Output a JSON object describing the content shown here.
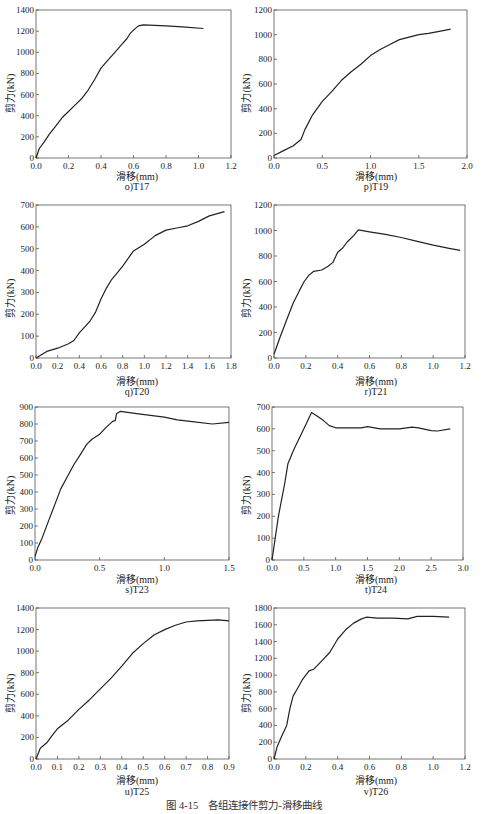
{
  "figure": {
    "caption": "图 4-15　各组连接件剪力-滑移曲线"
  },
  "chart_data": [
    {
      "id": "o",
      "type": "line",
      "subtitle": "o)T17",
      "xlabel": "滑移(mm)",
      "ylabel": "剪力(kN)",
      "xlim": [
        0,
        1.2
      ],
      "ylim": [
        0,
        1400
      ],
      "xticks": [
        0.0,
        0.2,
        0.4,
        0.6,
        0.8,
        1.0,
        1.2
      ],
      "xtick_labels": [
        "0.0",
        "0.2",
        "0.4",
        "0.6",
        "0.8",
        "1.0",
        "1.2"
      ],
      "yticks": [
        0,
        200,
        400,
        600,
        800,
        1000,
        1200,
        1400
      ],
      "grid": false,
      "x": [
        0,
        0.02,
        0.05,
        0.08,
        0.12,
        0.16,
        0.2,
        0.24,
        0.28,
        0.32,
        0.36,
        0.4,
        0.44,
        0.48,
        0.52,
        0.56,
        0.58,
        0.6,
        0.63,
        0.66,
        0.8,
        0.9,
        1.03
      ],
      "y": [
        0,
        90,
        150,
        220,
        300,
        380,
        440,
        500,
        560,
        640,
        740,
        850,
        920,
        990,
        1060,
        1130,
        1180,
        1210,
        1250,
        1260,
        1250,
        1240,
        1225
      ]
    },
    {
      "id": "p",
      "type": "line",
      "subtitle": "p)T19",
      "xlabel": "滑移(mm)",
      "ylabel": "剪力(kN)",
      "xlim": [
        0,
        2.0
      ],
      "ylim": [
        0,
        1200
      ],
      "xticks": [
        0.0,
        0.5,
        1.0,
        1.5,
        2.0
      ],
      "xtick_labels": [
        "0.0",
        "0.5",
        "1.0",
        "1.5",
        "2.0"
      ],
      "yticks": [
        0,
        200,
        400,
        600,
        800,
        1000,
        1200
      ],
      "grid": false,
      "x": [
        0,
        0.1,
        0.2,
        0.28,
        0.32,
        0.4,
        0.5,
        0.6,
        0.7,
        0.8,
        0.9,
        1.0,
        1.1,
        1.2,
        1.3,
        1.4,
        1.5,
        1.6,
        1.7,
        1.83
      ],
      "y": [
        20,
        60,
        100,
        150,
        230,
        350,
        460,
        540,
        630,
        700,
        760,
        830,
        880,
        920,
        960,
        980,
        1000,
        1010,
        1025,
        1045
      ]
    },
    {
      "id": "q",
      "type": "line",
      "subtitle": "q)T20",
      "xlabel": "滑移(mm)",
      "ylabel": "剪力(kN)",
      "xlim": [
        0,
        1.8
      ],
      "ylim": [
        0,
        700
      ],
      "xticks": [
        0.0,
        0.2,
        0.4,
        0.6,
        0.8,
        1.0,
        1.2,
        1.4,
        1.6,
        1.8
      ],
      "xtick_labels": [
        "0.0",
        "0.2",
        "0.4",
        "0.6",
        "0.8",
        "1.0",
        "1.2",
        "1.4",
        "1.6",
        "1.8"
      ],
      "yticks": [
        0,
        100,
        200,
        300,
        400,
        500,
        600,
        700
      ],
      "grid": false,
      "x": [
        0,
        0.1,
        0.2,
        0.3,
        0.35,
        0.4,
        0.5,
        0.55,
        0.6,
        0.65,
        0.7,
        0.75,
        0.8,
        0.9,
        1.0,
        1.1,
        1.2,
        1.3,
        1.4,
        1.5,
        1.6,
        1.74
      ],
      "y": [
        0,
        30,
        45,
        65,
        80,
        115,
        170,
        210,
        270,
        320,
        360,
        390,
        420,
        490,
        520,
        560,
        585,
        595,
        605,
        625,
        650,
        670
      ]
    },
    {
      "id": "r",
      "type": "line",
      "subtitle": "r)T21",
      "xlabel": "滑移(mm)",
      "ylabel": "剪力(kN)",
      "xlim": [
        0,
        1.2
      ],
      "ylim": [
        0,
        1200
      ],
      "xticks": [
        0.0,
        0.2,
        0.4,
        0.6,
        0.8,
        1.0,
        1.2
      ],
      "xtick_labels": [
        "0.0",
        "0.2",
        "0.4",
        "0.6",
        "0.8",
        "1.0",
        "1.2"
      ],
      "yticks": [
        0,
        200,
        400,
        600,
        800,
        1000,
        1200
      ],
      "grid": false,
      "x": [
        0,
        0.04,
        0.08,
        0.12,
        0.16,
        0.19,
        0.22,
        0.25,
        0.3,
        0.34,
        0.37,
        0.4,
        0.43,
        0.46,
        0.5,
        0.53,
        0.6,
        0.7,
        0.8,
        0.9,
        1.0,
        1.1,
        1.17
      ],
      "y": [
        30,
        170,
        300,
        430,
        530,
        600,
        650,
        680,
        690,
        720,
        750,
        830,
        860,
        910,
        960,
        1005,
        990,
        970,
        945,
        915,
        885,
        860,
        845
      ]
    },
    {
      "id": "s",
      "type": "line",
      "subtitle": "s)T23",
      "xlabel": "滑移(mm)",
      "ylabel": "剪力(kN)",
      "xlim": [
        0,
        1.5
      ],
      "ylim": [
        0,
        900
      ],
      "xticks": [
        0.0,
        0.5,
        1.0,
        1.5
      ],
      "xtick_labels": [
        "0.0",
        "0.5",
        "1.0",
        "1.5"
      ],
      "yticks": [
        0,
        100,
        200,
        300,
        400,
        500,
        600,
        700,
        800,
        900
      ],
      "grid": false,
      "x": [
        0,
        0.02,
        0.05,
        0.1,
        0.15,
        0.2,
        0.25,
        0.3,
        0.35,
        0.4,
        0.44,
        0.5,
        0.55,
        0.6,
        0.62,
        0.63,
        0.66,
        0.8,
        1.0,
        1.1,
        1.2,
        1.37,
        1.5
      ],
      "y": [
        20,
        70,
        120,
        220,
        320,
        420,
        490,
        560,
        620,
        680,
        710,
        740,
        780,
        815,
        820,
        860,
        875,
        860,
        840,
        825,
        815,
        800,
        810
      ]
    },
    {
      "id": "t",
      "type": "line",
      "subtitle": "t)T24",
      "xlabel": "滑移(mm)",
      "ylabel": "剪力(kN)",
      "xlim": [
        0,
        3.0
      ],
      "ylim": [
        0,
        700
      ],
      "xticks": [
        0.0,
        0.5,
        1.0,
        1.5,
        2.0,
        2.5,
        3.0
      ],
      "xtick_labels": [
        "0.0",
        "0.5",
        "1.0",
        "1.5",
        "2.0",
        "2.5",
        "3.0"
      ],
      "yticks": [
        0,
        100,
        200,
        300,
        400,
        500,
        600,
        700
      ],
      "grid": false,
      "x": [
        0,
        0.05,
        0.1,
        0.2,
        0.25,
        0.35,
        0.45,
        0.55,
        0.62,
        0.7,
        0.8,
        0.9,
        1.0,
        1.2,
        1.4,
        1.5,
        1.7,
        2.0,
        2.2,
        2.3,
        2.5,
        2.6,
        2.8
      ],
      "y": [
        0,
        100,
        200,
        350,
        440,
        510,
        570,
        630,
        675,
        660,
        640,
        615,
        605,
        605,
        605,
        610,
        600,
        600,
        608,
        605,
        592,
        590,
        600
      ]
    },
    {
      "id": "u",
      "type": "line",
      "subtitle": "u)T25",
      "xlabel": "滑移(mm)",
      "ylabel": "剪力(kN)",
      "xlim": [
        0,
        0.9
      ],
      "ylim": [
        0,
        1400
      ],
      "xticks": [
        0.0,
        0.1,
        0.2,
        0.3,
        0.4,
        0.5,
        0.6,
        0.7,
        0.8,
        0.9
      ],
      "xtick_labels": [
        "0.0",
        "0.1",
        "0.2",
        "0.3",
        "0.4",
        "0.5",
        "0.6",
        "0.7",
        "0.8",
        "0.9"
      ],
      "yticks": [
        0,
        200,
        400,
        600,
        800,
        1000,
        1200,
        1400
      ],
      "grid": false,
      "x": [
        0,
        0.02,
        0.05,
        0.08,
        0.1,
        0.15,
        0.2,
        0.25,
        0.3,
        0.35,
        0.4,
        0.45,
        0.5,
        0.55,
        0.6,
        0.65,
        0.7,
        0.75,
        0.8,
        0.85,
        0.9
      ],
      "y": [
        0,
        100,
        150,
        230,
        280,
        360,
        460,
        550,
        650,
        750,
        860,
        980,
        1070,
        1150,
        1200,
        1240,
        1270,
        1280,
        1285,
        1290,
        1280
      ]
    },
    {
      "id": "v",
      "type": "line",
      "subtitle": "v)T26",
      "xlabel": "滑移(mm)",
      "ylabel": "剪力(kN)",
      "xlim": [
        0,
        1.2
      ],
      "ylim": [
        0,
        1800
      ],
      "xticks": [
        0.0,
        0.2,
        0.4,
        0.6,
        0.8,
        1.0,
        1.2
      ],
      "xtick_labels": [
        "0.0",
        "0.2",
        "0.4",
        "0.6",
        "0.8",
        "1.0",
        "1.2"
      ],
      "yticks": [
        0,
        200,
        400,
        600,
        800,
        1000,
        1200,
        1400,
        1600,
        1800
      ],
      "grid": false,
      "x": [
        0,
        0.02,
        0.05,
        0.08,
        0.1,
        0.12,
        0.15,
        0.18,
        0.22,
        0.25,
        0.3,
        0.35,
        0.4,
        0.45,
        0.5,
        0.55,
        0.58,
        0.65,
        0.75,
        0.84,
        0.9,
        1.0,
        1.1
      ],
      "y": [
        0,
        150,
        280,
        400,
        600,
        750,
        850,
        950,
        1050,
        1070,
        1170,
        1270,
        1430,
        1540,
        1620,
        1670,
        1690,
        1680,
        1680,
        1670,
        1700,
        1700,
        1690
      ]
    }
  ]
}
